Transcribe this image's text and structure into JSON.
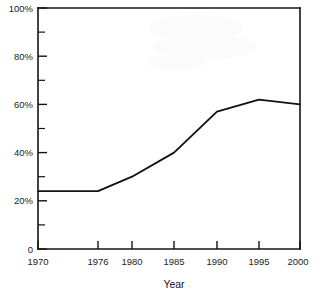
{
  "chart_data": {
    "type": "line",
    "title": "",
    "xlabel": "Year",
    "ylabel": "",
    "x": [
      1970,
      1976,
      1980,
      1985,
      1990,
      1995,
      2000
    ],
    "values": [
      24,
      24,
      30,
      40,
      57,
      62,
      60
    ],
    "series": [
      {
        "name": "",
        "values": [
          24,
          24,
          30,
          40,
          57,
          62,
          60
        ]
      }
    ],
    "categories": [
      "1970",
      "1976",
      "1980",
      "1985",
      "1990",
      "1995",
      "2000"
    ],
    "xlim": [
      1970,
      2000
    ],
    "ylim": [
      0,
      100
    ],
    "grid": false,
    "legend": "none",
    "y_tick_labels": [
      "0",
      "20%",
      "40%",
      "60%",
      "80%",
      "100%"
    ],
    "y_tick_values": [
      0,
      20,
      40,
      60,
      80,
      100
    ],
    "y_minor_tick_values": [
      10,
      30,
      50,
      70,
      90
    ],
    "x_tick_labels": [
      "1970",
      "1976",
      "1980",
      "1985",
      "1990",
      "1995",
      "2000"
    ],
    "x_tick_values": [
      1970,
      1976,
      1980,
      1985,
      1990,
      1995,
      2000
    ],
    "line_color": "#131313",
    "axis_color": "#141414",
    "background_color": "#ffffff"
  }
}
